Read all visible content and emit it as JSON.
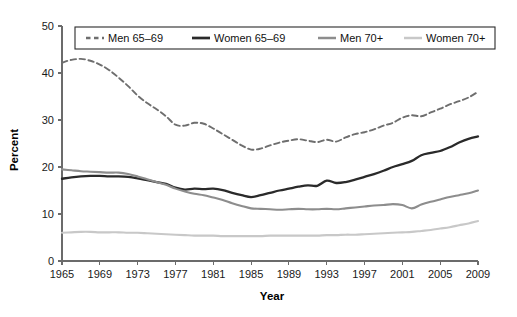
{
  "chart_data": {
    "type": "line",
    "title": "",
    "xlabel": "Year",
    "ylabel": "Percent",
    "xlim": [
      1965,
      2009
    ],
    "ylim": [
      0,
      50
    ],
    "grid": false,
    "legend_position": "top",
    "x_ticks": [
      1965,
      1969,
      1973,
      1977,
      1981,
      1985,
      1989,
      1993,
      1997,
      2001,
      2005,
      2009
    ],
    "y_ticks": [
      0,
      10,
      20,
      30,
      40,
      50
    ],
    "x": [
      1965,
      1966,
      1967,
      1968,
      1969,
      1970,
      1971,
      1972,
      1973,
      1974,
      1975,
      1976,
      1977,
      1978,
      1979,
      1980,
      1981,
      1982,
      1983,
      1984,
      1985,
      1986,
      1987,
      1988,
      1989,
      1990,
      1991,
      1992,
      1993,
      1994,
      1995,
      1996,
      1997,
      1998,
      1999,
      2000,
      2001,
      2002,
      2003,
      2004,
      2005,
      2006,
      2007,
      2008,
      2009
    ],
    "series": [
      {
        "name": "Men 65–69",
        "style": "dashed",
        "color": "#6e6e6e",
        "width": 1.9,
        "values": [
          42.2,
          42.8,
          43.0,
          42.6,
          41.8,
          40.6,
          39.0,
          37.2,
          35.2,
          33.6,
          32.3,
          30.8,
          29.0,
          28.8,
          29.4,
          29.2,
          28.2,
          27.0,
          25.8,
          24.6,
          23.7,
          23.9,
          24.6,
          25.2,
          25.6,
          25.9,
          25.6,
          25.3,
          25.8,
          25.4,
          26.3,
          27.0,
          27.4,
          28.0,
          28.8,
          29.4,
          30.5,
          31.0,
          30.8,
          31.6,
          32.4,
          33.3,
          34.0,
          34.8,
          36.0
        ]
      },
      {
        "name": "Women 65–69",
        "style": "solid",
        "color": "#2a2a2a",
        "width": 2.3,
        "values": [
          17.5,
          17.8,
          18.0,
          18.1,
          18.1,
          18.0,
          18.0,
          17.9,
          17.6,
          17.2,
          16.8,
          16.4,
          15.6,
          15.2,
          15.4,
          15.3,
          15.4,
          15.1,
          14.5,
          14.0,
          13.6,
          14.0,
          14.5,
          15.0,
          15.4,
          15.8,
          16.1,
          16.0,
          17.1,
          16.6,
          16.8,
          17.3,
          17.9,
          18.5,
          19.2,
          20.0,
          20.6,
          21.3,
          22.5,
          23.0,
          23.4,
          24.2,
          25.2,
          26.0,
          26.5
        ]
      },
      {
        "name": "Men 70+",
        "style": "solid",
        "color": "#8d8d8d",
        "width": 2.1,
        "values": [
          19.5,
          19.3,
          19.1,
          19.0,
          18.9,
          18.8,
          18.8,
          18.5,
          18.0,
          17.4,
          16.8,
          16.2,
          15.4,
          14.8,
          14.3,
          14.0,
          13.5,
          13.0,
          12.3,
          11.7,
          11.2,
          11.1,
          11.0,
          10.9,
          11.0,
          11.1,
          11.0,
          11.0,
          11.1,
          11.0,
          11.2,
          11.4,
          11.6,
          11.8,
          11.9,
          12.1,
          11.9,
          11.2,
          12.0,
          12.6,
          13.1,
          13.6,
          14.0,
          14.4,
          15.0
        ]
      },
      {
        "name": "Women 70+",
        "style": "solid",
        "color": "#c8c8c8",
        "width": 2.1,
        "values": [
          6.0,
          6.1,
          6.2,
          6.2,
          6.1,
          6.1,
          6.1,
          6.0,
          6.0,
          5.9,
          5.8,
          5.7,
          5.6,
          5.5,
          5.4,
          5.4,
          5.4,
          5.3,
          5.3,
          5.3,
          5.3,
          5.3,
          5.4,
          5.4,
          5.4,
          5.4,
          5.4,
          5.4,
          5.5,
          5.5,
          5.6,
          5.6,
          5.7,
          5.8,
          5.9,
          6.0,
          6.1,
          6.2,
          6.4,
          6.6,
          6.9,
          7.2,
          7.6,
          8.0,
          8.5
        ]
      }
    ]
  },
  "legend": {
    "items": [
      {
        "label": "Men 65–69"
      },
      {
        "label": "Women 65–69"
      },
      {
        "label": "Men 70+"
      },
      {
        "label": "Women 70+"
      }
    ]
  },
  "axes": {
    "y_title": "Percent",
    "x_title": "Year",
    "y_tick_labels": [
      "0",
      "10",
      "20",
      "30",
      "40",
      "50"
    ],
    "x_tick_labels": [
      "1965",
      "1969",
      "1973",
      "1977",
      "1981",
      "1985",
      "1989",
      "1993",
      "1997",
      "2001",
      "2005",
      "2009"
    ]
  },
  "colors": {
    "men_65_69": "#6e6e6e",
    "women_65_69": "#2a2a2a",
    "men_70_plus": "#8d8d8d",
    "women_70_plus": "#c8c8c8",
    "axis": "#6b6b6b",
    "background": "#ffffff"
  }
}
